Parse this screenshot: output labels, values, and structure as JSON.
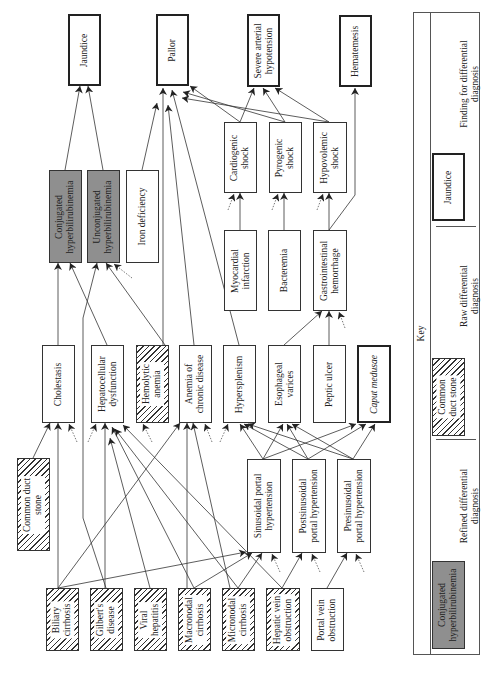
{
  "nodes": {
    "jaundice": {
      "label": "Jaundice",
      "type": "finding"
    },
    "pallor": {
      "label": "Pallor",
      "type": "finding"
    },
    "severe_hypotension": {
      "label": "Severe arterial\nhypotension",
      "type": "finding"
    },
    "hematemesis": {
      "label": "Hematemesis",
      "type": "finding"
    },
    "conj_hyperbili": {
      "label": "Conjugated\nhyperbilirubinemia",
      "type": "refined"
    },
    "unconj_hyperbili": {
      "label": "Unconjugated\nhyperbilirubinemia",
      "type": "refined"
    },
    "iron_deficiency": {
      "label": "Iron deficiency",
      "type": "plain"
    },
    "cardiogenic_shock": {
      "label": "Cardiogenic\nshock",
      "type": "plain"
    },
    "pyrogenic_shock": {
      "label": "Pyrogenic\nshock",
      "type": "plain"
    },
    "hypovolemic_shock": {
      "label": "Hypovolemic\nshock",
      "type": "plain"
    },
    "myocardial_infarction": {
      "label": "Myocardial\ninfarction",
      "type": "plain"
    },
    "bacteremia": {
      "label": "Bacteremia",
      "type": "plain"
    },
    "gi_hemorrhage": {
      "label": "Gastrointestinal\nhemorrhage",
      "type": "plain"
    },
    "cholestasis": {
      "label": "Cholestasis",
      "type": "plain"
    },
    "hepatocellular_dysfunction": {
      "label": "Hepatocellular\ndysfunction",
      "type": "plain"
    },
    "hemolytic_anemia": {
      "label": "Hemolytic\nanemia",
      "type": "raw"
    },
    "anemia_chronic": {
      "label": "Anemia of\nchronic disease",
      "type": "plain"
    },
    "hypersplenism": {
      "label": "Hypersplenism",
      "type": "plain"
    },
    "esophageal_varices": {
      "label": "Esophageal\nvarices",
      "type": "plain"
    },
    "peptic_ulcer": {
      "label": "Peptic ulcer",
      "type": "plain"
    },
    "caput_medusae": {
      "label": "Caput medusae",
      "type": "finding"
    },
    "common_duct_stone": {
      "label": "Common duct\nstone",
      "type": "raw"
    },
    "sinusoidal_ph": {
      "label": "Sinusoidal portal\nhypertension",
      "type": "plain"
    },
    "postsinusoidal_ph": {
      "label": "Postsinusoidal\nportal hypertension",
      "type": "plain"
    },
    "presinusoidal_ph": {
      "label": "Presinusoidal\nportal hypertension",
      "type": "plain"
    },
    "biliary_cirrhosis": {
      "label": "Biliary\ncirrhosis",
      "type": "raw"
    },
    "gilberts": {
      "label": "Gilbert's\ndisease",
      "type": "raw"
    },
    "viral_hepatitis": {
      "label": "Viral\nhepatitis",
      "type": "raw"
    },
    "macronodal_cirrhosis": {
      "label": "Macronodal\ncirrhosis",
      "type": "raw"
    },
    "micronodal_cirrhosis": {
      "label": "Micronodal\ncirrhosis",
      "type": "raw"
    },
    "hepatic_vein_obstruction": {
      "label": "Hepatic vein\nobstruction",
      "type": "raw"
    },
    "portal_vein_obstruction": {
      "label": "Portal vein\nobstruction",
      "type": "plain"
    }
  },
  "edges": [
    [
      "conj_hyperbili",
      "jaundice"
    ],
    [
      "unconj_hyperbili",
      "jaundice"
    ],
    [
      "iron_deficiency",
      "pallor"
    ],
    [
      "anemia_chronic",
      "pallor"
    ],
    [
      "hemolytic_anemia",
      "pallor"
    ],
    [
      "hypersplenism",
      "pallor"
    ],
    [
      "cardiogenic_shock",
      "pallor"
    ],
    [
      "pyrogenic_shock",
      "pallor"
    ],
    [
      "hypovolemic_shock",
      "pallor"
    ],
    [
      "cardiogenic_shock",
      "severe_hypotension"
    ],
    [
      "pyrogenic_shock",
      "severe_hypotension"
    ],
    [
      "hypovolemic_shock",
      "severe_hypotension"
    ],
    [
      "gi_hemorrhage",
      "hematemesis"
    ],
    [
      "myocardial_infarction",
      "cardiogenic_shock"
    ],
    [
      "bacteremia",
      "pyrogenic_shock"
    ],
    [
      "gi_hemorrhage",
      "hypovolemic_shock"
    ],
    [
      "esophageal_varices",
      "gi_hemorrhage"
    ],
    [
      "peptic_ulcer",
      "gi_hemorrhage"
    ],
    [
      "cholestasis",
      "conj_hyperbili"
    ],
    [
      "hepatocellular_dysfunction",
      "conj_hyperbili"
    ],
    [
      "gilberts",
      "unconj_hyperbili"
    ],
    [
      "hemolytic_anemia",
      "unconj_hyperbili"
    ],
    [
      "common_duct_stone",
      "cholestasis"
    ],
    [
      "biliary_cirrhosis",
      "cholestasis"
    ],
    [
      "gilberts",
      "hepatocellular_dysfunction"
    ],
    [
      "viral_hepatitis",
      "hepatocellular_dysfunction"
    ],
    [
      "macronodal_cirrhosis",
      "hepatocellular_dysfunction"
    ],
    [
      "micronodal_cirrhosis",
      "hepatocellular_dysfunction"
    ],
    [
      "hepatic_vein_obstruction",
      "hepatocellular_dysfunction"
    ],
    [
      "biliary_cirrhosis",
      "anemia_chronic"
    ],
    [
      "macronodal_cirrhosis",
      "anemia_chronic"
    ],
    [
      "micronodal_cirrhosis",
      "anemia_chronic"
    ],
    [
      "biliary_cirrhosis",
      "sinusoidal_ph"
    ],
    [
      "macronodal_cirrhosis",
      "sinusoidal_ph"
    ],
    [
      "micronodal_cirrhosis",
      "sinusoidal_ph"
    ],
    [
      "hepatic_vein_obstruction",
      "postsinusoidal_ph"
    ],
    [
      "portal_vein_obstruction",
      "presinusoidal_ph"
    ],
    [
      "sinusoidal_ph",
      "hypersplenism"
    ],
    [
      "sinusoidal_ph",
      "esophageal_varices"
    ],
    [
      "sinusoidal_ph",
      "caput_medusae"
    ],
    [
      "postsinusoidal_ph",
      "hypersplenism"
    ],
    [
      "postsinusoidal_ph",
      "esophageal_varices"
    ],
    [
      "postsinusoidal_ph",
      "caput_medusae"
    ],
    [
      "presinusoidal_ph",
      "hypersplenism"
    ],
    [
      "presinusoidal_ph",
      "esophageal_varices"
    ],
    [
      "presinusoidal_ph",
      "caput_medusae"
    ]
  ],
  "key": {
    "title": "Key",
    "items": [
      {
        "sample": "Conjugated\nhyperbilirubinemia",
        "description": "Refined differential\ndiagnosis"
      },
      {
        "sample": "Common\nduct stone",
        "description": "Raw differential\ndiagnosis"
      },
      {
        "sample": "Jaundice",
        "description": "Finding for differential\ndiagnosis"
      }
    ]
  },
  "colors": {
    "refined_fill": "#8f8f8f",
    "stroke": "#333333",
    "background": "#ffffff"
  }
}
